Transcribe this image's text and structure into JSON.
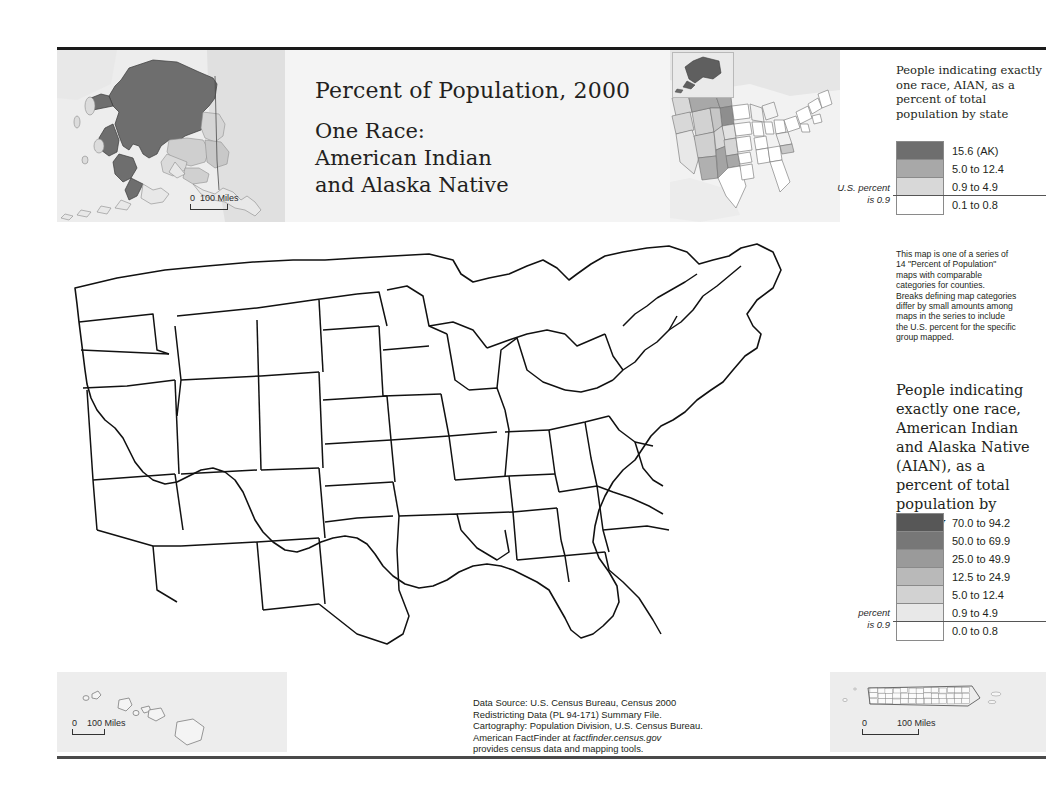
{
  "poster": {
    "title_main": "Percent of Population, 2000",
    "title_sub_line1": "One Race:",
    "title_sub_line2": "American Indian",
    "title_sub_line3": "and Alaska Native"
  },
  "state_legend": {
    "heading": "People indicating exactly one race, AIAN, as a percent of total population by state",
    "us_percent_line1": "U.S. percent",
    "us_percent_line2": "is 0.9",
    "classes": [
      {
        "label": "15.6 (AK)",
        "color": "#6e6e6e"
      },
      {
        "label": "5.0 to 12.4",
        "color": "#a8a8a8"
      },
      {
        "label": "0.9 to 4.9",
        "color": "#d8d8d8"
      },
      {
        "label": "0.1 to 0.8",
        "color": "#ffffff"
      }
    ]
  },
  "county_legend": {
    "heading_line1": "People indicating",
    "heading_line2": "exactly one race,",
    "heading_line3": "American Indian",
    "heading_line4": "and Alaska Native",
    "heading_line5": "(AIAN), as a",
    "heading_line6": "percent of total",
    "heading_line7": "population by",
    "heading_line8": "county",
    "us_percent_line1": "U.S. percent",
    "us_percent_line2": "is 0.9",
    "classes": [
      {
        "label": "70.0 to 94.2",
        "color": "#575757"
      },
      {
        "label": "50.0 to 69.9",
        "color": "#777777"
      },
      {
        "label": "25.0 to 49.9",
        "color": "#9a9a9a"
      },
      {
        "label": "12.5 to 24.9",
        "color": "#b9b9b9"
      },
      {
        "label": "5.0 to 12.4",
        "color": "#d2d2d2"
      },
      {
        "label": "0.9 to 4.9",
        "color": "#e8e8e8"
      },
      {
        "label": "0.0 to 0.8",
        "color": "#ffffff"
      }
    ]
  },
  "series_note": {
    "line1": "This map is one of a series of",
    "line2": "14 \"Percent of Population\"",
    "line3": "maps with comparable",
    "line4": "categories for counties.",
    "line5": "Breaks defining map categories",
    "line6": "differ by small amounts among",
    "line7": "maps in the series to include",
    "line8": "the U.S. percent for the specific",
    "line9": "group mapped."
  },
  "source_note": {
    "line1": "Data Source: U.S. Census Bureau, Census 2000",
    "line2": "Redistricting Data (PL 94-171) Summary File.",
    "line3": "Cartography: Population Division, U.S. Census Bureau.",
    "line4_prefix": "American FactFinder at ",
    "line4_italic": "factfinder.census.gov",
    "line5": "provides census data and mapping tools."
  },
  "scalebars": {
    "alaska": {
      "zero": "0",
      "distance": "100 Miles"
    },
    "hawaii": {
      "zero": "0",
      "distance": "100 Miles"
    },
    "puertorico": {
      "zero": "0",
      "distance": "100 Miles"
    }
  },
  "map_colors": {
    "water": "#ffffff",
    "land_outside": "#e3e3e3",
    "county_border": "#9b9b9b",
    "state_border": "#1a1a1a",
    "panel_bg": "#ededed"
  },
  "chart_data": {
    "type": "choropleth-map",
    "measure": "People indicating exactly one race, AIAN, as a percent of total population",
    "us_percent": 0.9,
    "units": "percent",
    "county_bins": [
      {
        "min": 0.0,
        "max": 0.8,
        "color": "#ffffff"
      },
      {
        "min": 0.9,
        "max": 4.9,
        "color": "#e8e8e8"
      },
      {
        "min": 5.0,
        "max": 12.4,
        "color": "#d2d2d2"
      },
      {
        "min": 12.5,
        "max": 24.9,
        "color": "#b9b9b9"
      },
      {
        "min": 25.0,
        "max": 49.9,
        "color": "#9a9a9a"
      },
      {
        "min": 50.0,
        "max": 69.9,
        "color": "#777777"
      },
      {
        "min": 70.0,
        "max": 94.2,
        "color": "#575757"
      }
    ],
    "state_bins": [
      {
        "min": 0.1,
        "max": 0.8,
        "color": "#ffffff"
      },
      {
        "min": 0.9,
        "max": 4.9,
        "color": "#d8d8d8"
      },
      {
        "min": 5.0,
        "max": 12.4,
        "color": "#a8a8a8"
      },
      {
        "min": 15.6,
        "max": 15.6,
        "color": "#6e6e6e",
        "note": "15.6 (AK)"
      }
    ],
    "max_county_value": 94.2,
    "max_state_value": 15.6,
    "notable_high_states": [
      "Alaska",
      "New Mexico",
      "South Dakota",
      "Oklahoma",
      "Montana",
      "Arizona",
      "North Dakota"
    ],
    "notable_high_counties": [
      "Shannon SD",
      "Todd SD",
      "Apache AZ",
      "McKinley NM",
      "Sioux ND",
      "Big Horn MT",
      "Menominee WI",
      "Robeson NC",
      "Swain NC"
    ]
  }
}
